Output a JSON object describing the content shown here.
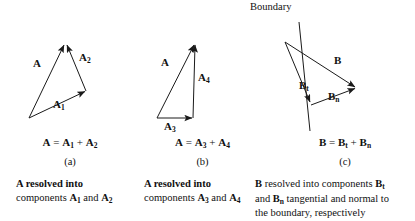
{
  "figure": {
    "background_color": "#ffffff",
    "stroke_color": "#1a1a1a"
  },
  "panel_a": {
    "letter": "(a)",
    "equation": {
      "lhs": "A",
      "eq": "=",
      "term1": "A",
      "term1_sub": "1",
      "plus": "+",
      "term2": "A",
      "term2_sub": "2"
    },
    "caption_line1": "A resolved into",
    "caption_line2_pre": "components ",
    "caption_b1": "A",
    "caption_b1_sub": "1",
    "caption_and": " and ",
    "caption_b2": "A",
    "caption_b2_sub": "2",
    "vectors": [
      {
        "name": "A",
        "label": "A",
        "sub": "",
        "x1": 29,
        "y1": 118,
        "x2": 64,
        "y2": 43
      },
      {
        "name": "A1",
        "label": "A",
        "sub": "1",
        "x1": 29,
        "y1": 118,
        "x2": 86,
        "y2": 91
      },
      {
        "name": "A2",
        "label": "A",
        "sub": "2",
        "x1": 86,
        "y1": 91,
        "x2": 66,
        "y2": 43
      }
    ],
    "labels": {
      "A": {
        "text": "A",
        "sub": "",
        "x": 36,
        "y": 63
      },
      "A1": {
        "text": "A",
        "sub": "1",
        "x": 55,
        "y": 103
      },
      "A2": {
        "text": "A",
        "sub": "2",
        "x": 81,
        "y": 56
      }
    }
  },
  "panel_b": {
    "letter": "(b)",
    "equation": {
      "lhs": "A",
      "eq": "=",
      "term1": "A",
      "term1_sub": "3",
      "plus": "+",
      "term2": "A",
      "term2_sub": "4"
    },
    "caption_line1": "A resolved into",
    "caption_line2_pre": "components ",
    "caption_b1": "A",
    "caption_b1_sub": "3",
    "caption_and": " and ",
    "caption_b2": "A",
    "caption_b2_sub": "4",
    "vectors": [
      {
        "name": "A",
        "label": "A",
        "sub": "",
        "x1": 17,
        "y1": 118,
        "x2": 55,
        "y2": 43
      },
      {
        "name": "A3",
        "label": "A",
        "sub": "3",
        "x1": 17,
        "y1": 118,
        "x2": 53,
        "y2": 118
      },
      {
        "name": "A4",
        "label": "A",
        "sub": "4",
        "x1": 53,
        "y1": 118,
        "x2": 55,
        "y2": 43
      }
    ],
    "labels": {
      "A": {
        "text": "A",
        "sub": "",
        "x": 24,
        "y": 62
      },
      "A3": {
        "text": "A",
        "sub": "3",
        "x": 26,
        "y": 123
      },
      "A4": {
        "text": "A",
        "sub": "4",
        "x": 58,
        "y": 76
      }
    }
  },
  "panel_c": {
    "letter": "(c)",
    "boundary_label": "Boundary",
    "equation": {
      "lhs": "B",
      "eq": "=",
      "term1": "B",
      "term1_sub": "t",
      "plus": "+",
      "term2": "B",
      "term2_sub": "n"
    },
    "caption_line1_pre": "B",
    "caption_line1_rest": " resolved into components ",
    "caption_b1": "B",
    "caption_b1_sub": "t",
    "caption_line2_and": "and ",
    "caption_b2": "B",
    "caption_b2_sub": "n",
    "caption_line2_rest": " tangential and normal to",
    "caption_line3": "the boundary, respectively",
    "boundary_line": {
      "x1": 24,
      "y1": 22,
      "x2": 35,
      "y2": 131
    },
    "vectors": [
      {
        "name": "B",
        "label": "B",
        "sub": "",
        "x1": 10,
        "y1": 42,
        "x2": 82,
        "y2": 88
      },
      {
        "name": "Bt",
        "label": "B",
        "sub": "t",
        "x1": 10,
        "y1": 42,
        "x2": 36,
        "y2": 105
      },
      {
        "name": "Bn",
        "label": "B",
        "sub": "n",
        "x1": 36,
        "y1": 105,
        "x2": 82,
        "y2": 88
      }
    ],
    "labels": {
      "B": {
        "text": "B",
        "sub": "",
        "x": 60,
        "y": 60
      },
      "Bt": {
        "text": "B",
        "sub": "t",
        "x": 26,
        "y": 84
      },
      "Bn": {
        "text": "B",
        "sub": "n",
        "x": 54,
        "y": 95
      }
    }
  }
}
